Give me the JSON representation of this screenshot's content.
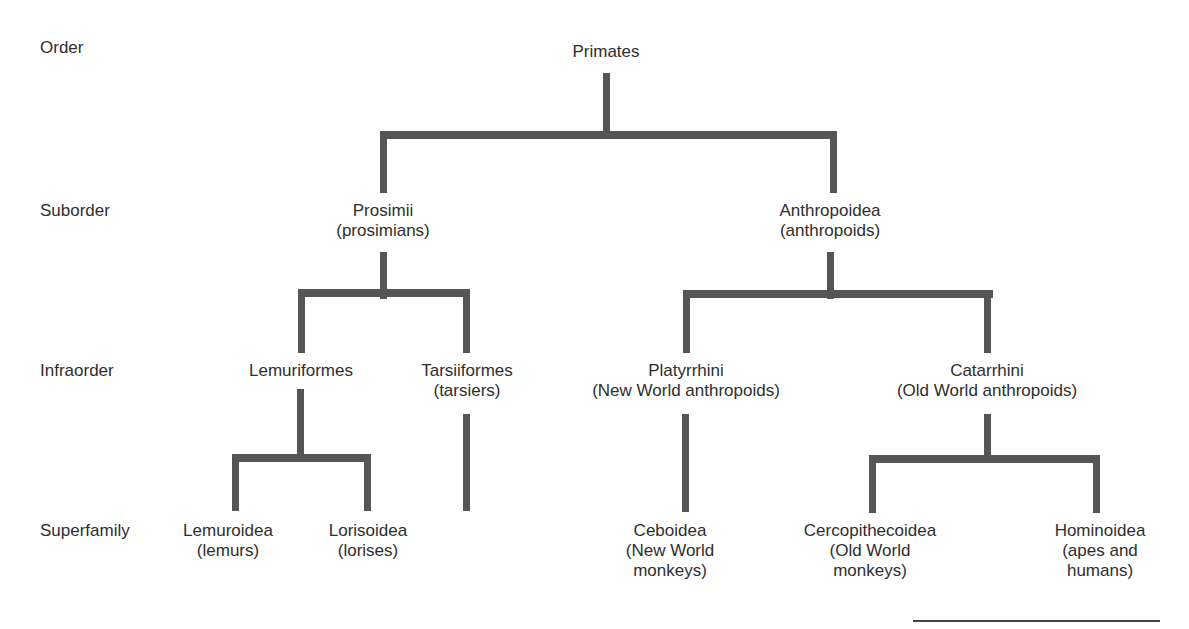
{
  "diagram": {
    "type": "taxonomy-tree",
    "connector_color": "#555555",
    "text_color": "#2e2e2e"
  },
  "ranks": [
    {
      "label": "Order",
      "y": 38
    },
    {
      "label": "Suborder",
      "y": 201
    },
    {
      "label": "Infraorder",
      "y": 361
    },
    {
      "label": "Superfamily",
      "y": 521
    }
  ],
  "nodes": {
    "primates": {
      "name": "Primates",
      "common": ""
    },
    "prosimii": {
      "name": "Prosimii",
      "common": "(prosimians)"
    },
    "anthropoidea": {
      "name": "Anthropoidea",
      "common": "(anthropoids)"
    },
    "lemuriformes": {
      "name": "Lemuriformes",
      "common": ""
    },
    "tarsiiformes": {
      "name": "Tarsiiformes",
      "common": "(tarsiers)"
    },
    "platyrrhini": {
      "name": "Platyrrhini",
      "common": "(New World anthropoids)"
    },
    "catarrhini": {
      "name": "Catarrhini",
      "common": "(Old World anthropoids)"
    },
    "lemuroidea": {
      "name": "Lemuroidea",
      "common": "(lemurs)"
    },
    "lorisoidea": {
      "name": "Lorisoidea",
      "common": "(lorises)"
    },
    "ceboidea": {
      "name": "Ceboidea",
      "common1": "(New World",
      "common2": "monkeys)"
    },
    "cercopithecoidea": {
      "name": "Cercopithecoidea",
      "common1": "(Old World",
      "common2": "monkeys)"
    },
    "hominoidea": {
      "name": "Hominoidea",
      "common1": "(apes and",
      "common2": "humans)"
    }
  },
  "edges": [
    [
      "Primates",
      "Prosimii"
    ],
    [
      "Primates",
      "Anthropoidea"
    ],
    [
      "Prosimii",
      "Lemuriformes"
    ],
    [
      "Prosimii",
      "Tarsiiformes"
    ],
    [
      "Anthropoidea",
      "Platyrrhini"
    ],
    [
      "Anthropoidea",
      "Catarrhini"
    ],
    [
      "Lemuriformes",
      "Lemuroidea"
    ],
    [
      "Lemuriformes",
      "Lorisoidea"
    ],
    [
      "Platyrrhini",
      "Ceboidea"
    ],
    [
      "Catarrhini",
      "Cercopithecoidea"
    ],
    [
      "Catarrhini",
      "Hominoidea"
    ]
  ]
}
